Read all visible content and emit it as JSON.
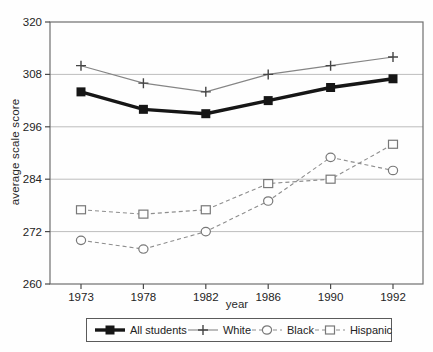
{
  "chart_data": {
    "type": "line",
    "title": "",
    "xlabel": "year",
    "ylabel": "average scale score",
    "categories": [
      "1973",
      "1978",
      "1982",
      "1986",
      "1990",
      "1992"
    ],
    "series": [
      {
        "name": "All students",
        "values": [
          304,
          300,
          299,
          302,
          305,
          307
        ],
        "line": "solid-thick",
        "marker": "filled-square",
        "color": "#161616",
        "marker_color": "#161616"
      },
      {
        "name": "White",
        "values": [
          310,
          306,
          304,
          308,
          310,
          312
        ],
        "line": "solid-thin",
        "marker": "plus",
        "color": "#858585",
        "marker_color": "#454545"
      },
      {
        "name": "Black",
        "values": [
          270,
          268,
          272,
          279,
          289,
          286
        ],
        "line": "dashed",
        "marker": "open-circle",
        "color": "#8e8e8e",
        "marker_color": "#787878"
      },
      {
        "name": "Hispanic",
        "values": [
          277,
          276,
          277,
          283,
          284,
          292
        ],
        "line": "dashed",
        "marker": "open-square",
        "color": "#8e8e8e",
        "marker_color": "#787878"
      }
    ],
    "ylim": [
      260,
      320
    ],
    "yticks": [
      260,
      272,
      284,
      296,
      308,
      320
    ],
    "grid": "horizontal",
    "legend_position": "bottom",
    "colors": {
      "grid": "#bdbdbd",
      "frame": "#6e6e6e",
      "tick": "#4a4a4a",
      "text": "#242424",
      "background": "#fefefe"
    }
  }
}
